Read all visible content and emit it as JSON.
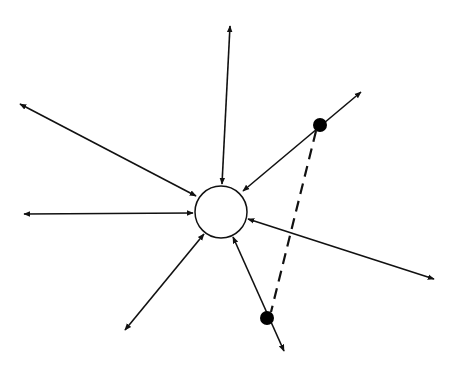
{
  "diagram": {
    "type": "star-network",
    "colors": {
      "stroke": "#111111",
      "background": "#ffffff",
      "node_fill": "#ffffff",
      "dot_fill": "#000000"
    },
    "center_node": {
      "cx": 221,
      "cy": 212,
      "r": 26
    },
    "edges": [
      {
        "id": "top",
        "outer": [
          230,
          26
        ],
        "inner": [
          222,
          184
        ]
      },
      {
        "id": "upper-left",
        "outer": [
          20,
          104
        ],
        "inner": [
          196,
          196
        ]
      },
      {
        "id": "left",
        "outer": [
          24,
          214
        ],
        "inner": [
          193,
          213
        ]
      },
      {
        "id": "lower-left",
        "outer": [
          125,
          330
        ],
        "inner": [
          204,
          234
        ]
      },
      {
        "id": "lower",
        "outer": [
          284,
          351
        ],
        "inner": [
          233,
          237
        ]
      },
      {
        "id": "right",
        "outer": [
          434,
          279
        ],
        "inner": [
          248,
          219
        ]
      },
      {
        "id": "upper-right",
        "outer": [
          361,
          92
        ],
        "inner": [
          243,
          191
        ]
      }
    ],
    "dots": [
      {
        "id": "dot-upper",
        "cx": 320,
        "cy": 125,
        "r": 7
      },
      {
        "id": "dot-lower",
        "cx": 267,
        "cy": 318,
        "r": 7
      }
    ],
    "dashed_link": {
      "from": "dot-upper",
      "to": "dot-lower"
    }
  }
}
